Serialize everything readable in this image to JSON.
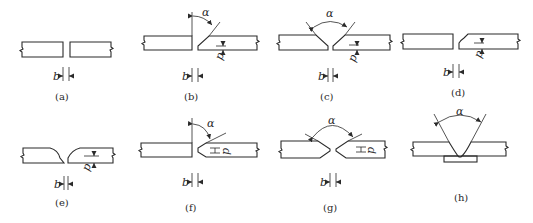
{
  "figure": {
    "symbols": {
      "gap": "b",
      "root_face": "p",
      "groove_angle": "α"
    },
    "panels": [
      {
        "id": "a",
        "caption": "(a)",
        "type": "square-butt",
        "labels": [
          "b"
        ]
      },
      {
        "id": "b",
        "caption": "(b)",
        "type": "single-bevel",
        "labels": [
          "α",
          "p",
          "b"
        ]
      },
      {
        "id": "c",
        "caption": "(c)",
        "type": "single-V",
        "labels": [
          "α",
          "p",
          "b"
        ]
      },
      {
        "id": "d",
        "caption": "(d)",
        "type": "single-J",
        "labels": [
          "p",
          "b"
        ]
      },
      {
        "id": "e",
        "caption": "(e)",
        "type": "single-U",
        "labels": [
          "p",
          "b"
        ]
      },
      {
        "id": "f",
        "caption": "(f)",
        "type": "double-bevel (K)",
        "labels": [
          "α",
          "p",
          "b"
        ]
      },
      {
        "id": "g",
        "caption": "(g)",
        "type": "double-V (X)",
        "labels": [
          "α",
          "p",
          "b"
        ]
      },
      {
        "id": "h",
        "caption": "(h)",
        "type": "V-groove with backing strip",
        "labels": [
          "α"
        ]
      }
    ]
  },
  "colors": {
    "line": "#2a2a2a",
    "background": "#ffffff"
  }
}
